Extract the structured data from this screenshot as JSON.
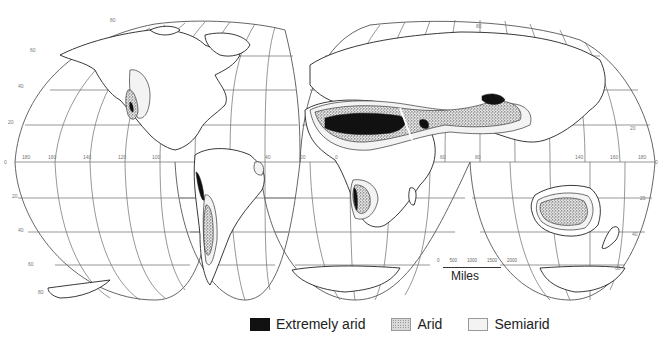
{
  "map": {
    "title": "World arid lands",
    "projection": "Interrupted homolosine",
    "latitude_labels_left": [
      "80",
      "60",
      "40",
      "20",
      "0",
      "20",
      "40",
      "60",
      "80"
    ],
    "latitude_labels_right": [
      "80",
      "60",
      "40",
      "20",
      "0",
      "20",
      "40",
      "60",
      "80"
    ],
    "longitude_labels": [
      "180",
      "160",
      "140",
      "120",
      "100",
      "80",
      "60",
      "40",
      "20",
      "0",
      "20",
      "40",
      "60",
      "80",
      "100",
      "120",
      "140",
      "160",
      "180"
    ],
    "scale_bar": {
      "ticks": [
        "0",
        "500",
        "1000",
        "1500",
        "2000"
      ],
      "unit_label": "Miles"
    }
  },
  "legend": {
    "items": [
      {
        "label": "Extremely arid",
        "swatch": "solid-black",
        "color": "#111111"
      },
      {
        "label": "Arid",
        "swatch": "stippled",
        "color": "#888888"
      },
      {
        "label": "Semiarid",
        "swatch": "light-fill",
        "color": "#f3f3f3"
      }
    ]
  }
}
